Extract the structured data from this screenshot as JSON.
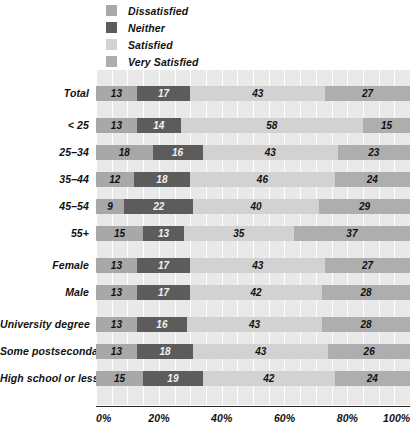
{
  "chart_data": {
    "type": "bar",
    "orientation": "horizontal",
    "stacked": true,
    "stack_total": 100,
    "title": "",
    "subtitle": "",
    "xlabel": "",
    "ylabel": "",
    "xlim": [
      0,
      100
    ],
    "xticks": [
      "0%",
      "20%",
      "40%",
      "60%",
      "80%",
      "100%"
    ],
    "xtick_values": [
      0,
      20,
      40,
      60,
      80,
      100
    ],
    "grid": true,
    "grid_axis": "x",
    "grid_interval": 5,
    "legend_position": "top-left",
    "legend": [
      "Dissatisfied",
      "Neither",
      "Satisfied",
      "Very Satisfied"
    ],
    "colors": {
      "Dissatisfied": "#a8a8a8",
      "Neither": "#5c5c5c",
      "Satisfied": "#d2d2d2",
      "Very Satisfied": "#aeaeae",
      "plot_background": "#e9e9e9",
      "gridline": "#ffffff",
      "axis": "#2a2a2a",
      "text": "#111111"
    },
    "categories": [
      "Total",
      "< 25",
      "25–34",
      "35–44",
      "45–54",
      "55+",
      "Female",
      "Male",
      "University degree",
      "Some postsecondary",
      "High school or less"
    ],
    "series": [
      {
        "name": "Dissatisfied",
        "values": [
          13,
          13,
          18,
          12,
          9,
          15,
          13,
          13,
          13,
          13,
          15
        ]
      },
      {
        "name": "Neither",
        "values": [
          17,
          14,
          16,
          18,
          22,
          13,
          17,
          17,
          16,
          18,
          19
        ]
      },
      {
        "name": "Satisfied",
        "values": [
          43,
          58,
          43,
          46,
          40,
          35,
          43,
          42,
          43,
          43,
          42
        ]
      },
      {
        "name": "Very Satisfied",
        "values": [
          27,
          15,
          23,
          24,
          29,
          37,
          27,
          28,
          28,
          26,
          24
        ]
      }
    ],
    "group_breaks_after": [
      "Total",
      "55+",
      "Male"
    ]
  },
  "legend": {
    "items": [
      {
        "label": "Dissatisfied",
        "swatch": "#a8a8a8"
      },
      {
        "label": "Neither",
        "swatch": "#5c5c5c"
      },
      {
        "label": "Satisfied",
        "swatch": "#d2d2d2"
      },
      {
        "label": "Very Satisfied",
        "swatch": "#aeaeae"
      }
    ]
  }
}
